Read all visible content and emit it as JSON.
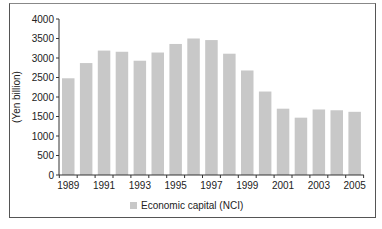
{
  "chart_data": {
    "type": "bar",
    "title": "",
    "xlabel": "",
    "ylabel": "(Yen billion)",
    "ylim": [
      0,
      4000
    ],
    "yticks": [
      0,
      500,
      1000,
      1500,
      2000,
      2500,
      3000,
      3500,
      4000
    ],
    "categories": [
      "1989",
      "1990",
      "1991",
      "1992",
      "1993",
      "1994",
      "1995",
      "1996",
      "1997",
      "1998",
      "1999",
      "2000",
      "2001",
      "2002",
      "2003",
      "2004",
      "2005"
    ],
    "xtick_labels": [
      "1989",
      "1991",
      "1993",
      "1995",
      "1997",
      "1999",
      "2001",
      "2003",
      "2005"
    ],
    "series": [
      {
        "name": "Economic capital (NCI)",
        "color": "#c8c8c8",
        "values": [
          2480,
          2870,
          3190,
          3160,
          2930,
          3140,
          3360,
          3500,
          3460,
          3110,
          2680,
          2140,
          1700,
          1470,
          1680,
          1660,
          1620
        ]
      }
    ],
    "legend": {
      "position": "bottom",
      "entries": [
        "Economic capital (NCI)"
      ]
    },
    "grid": false
  }
}
